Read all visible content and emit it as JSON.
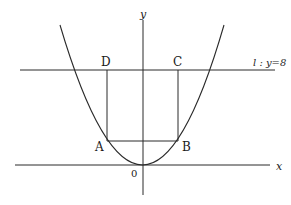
{
  "diagram": {
    "type": "coordinate-geometry",
    "axes": {
      "x_label": "x",
      "y_label": "y",
      "origin_label": "0"
    },
    "line_l": {
      "label": "l : y=8"
    },
    "points": {
      "A": {
        "label": "A"
      },
      "B": {
        "label": "B"
      },
      "C": {
        "label": "C"
      },
      "D": {
        "label": "D"
      }
    },
    "colors": {
      "stroke": "#2a2a2a",
      "background": "#ffffff"
    }
  }
}
